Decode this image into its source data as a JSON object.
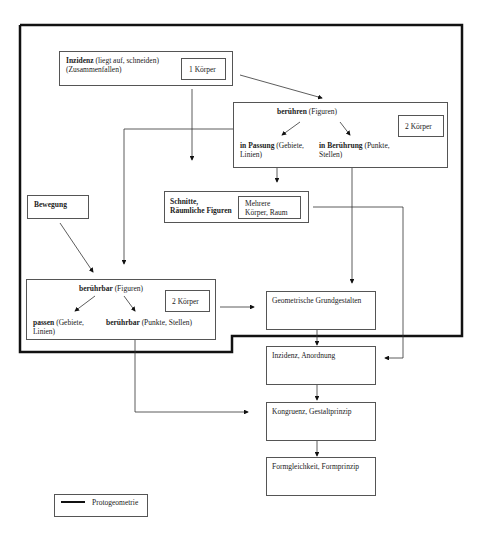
{
  "diagram": {
    "nodes": {
      "inzidenz": {
        "bold": "Inzidenz",
        "text1": " (liegt auf, schneiden)",
        "text2": "(Zusammenfallen)",
        "tag": "1 Körper"
      },
      "beruehren": {
        "bold": "berühren",
        "text": " (Figuren)",
        "tag": "2 Körper",
        "left_bold": "in Passung",
        "left_text1": " (Gebiete,",
        "left_text2": "Linien)",
        "right_bold": "in Berührung",
        "right_text1": " (Punkte,",
        "right_text2": "Stellen)"
      },
      "schnitte": {
        "bold1": "Schnitte,",
        "bold2": "Räumliche Figuren",
        "tag1": "Mehrere",
        "tag2": "Körper, Raum"
      },
      "bewegung": {
        "bold": "Bewegung"
      },
      "beruehrbar": {
        "bold": "berührbar",
        "text": " (Figuren)",
        "tag": "2 Körper",
        "left_bold": "passen",
        "left_text1": " (Gebiete,",
        "left_text2": "Linien)",
        "right_bold": "berührbar",
        "right_text": " (Punkte, Stellen)"
      },
      "grundgestalten": {
        "label": "Geometrische Grundgestalten"
      },
      "anordnung": {
        "label": "Inzidenz, Anordnung"
      },
      "kongruenz": {
        "label": "Kongruenz, Gestaltprinzip"
      },
      "formgleichheit": {
        "label": "Formgleichkeit, Formprinzip"
      }
    },
    "legend": {
      "label": "Protogeometrie"
    }
  }
}
